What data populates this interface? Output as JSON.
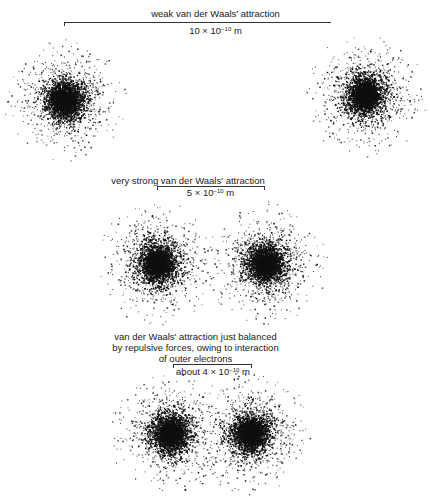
{
  "panels": [
    {
      "id": "weak",
      "caption_lines": [
        "weak van der Waals' attraction"
      ],
      "distance": {
        "mantissa": "10 × 10",
        "exponent": "−10",
        "unit": " m"
      }
    },
    {
      "id": "very-strong",
      "caption_lines": [
        "very strong van der Waals' attraction"
      ],
      "distance": {
        "mantissa": "5 × 10",
        "exponent": "−10",
        "unit": " m"
      }
    },
    {
      "id": "balanced",
      "caption_lines": [
        "van der Waals' attraction just balanced",
        "by repulsive forces, owing to interaction",
        "of outer electrons"
      ],
      "distance": {
        "mantissa": "about 4 × 10",
        "exponent": "−10",
        "unit": " m"
      }
    }
  ],
  "colors": {
    "ink": "#111111",
    "background": "#ffffff"
  }
}
